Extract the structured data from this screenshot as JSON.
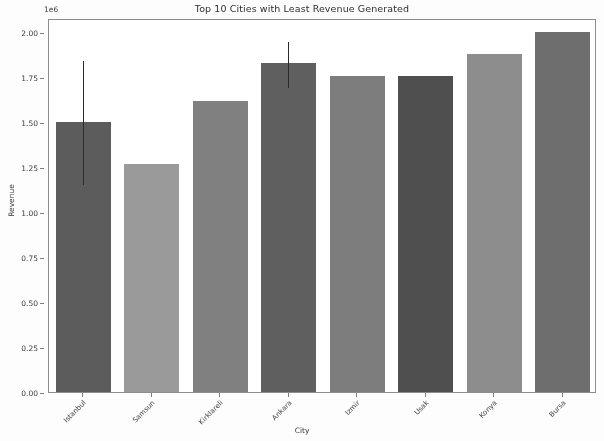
{
  "chart_data": {
    "type": "bar",
    "title": "Top 10 Cities with Least Revenue Generated",
    "xlabel": "City",
    "ylabel": "Revenue",
    "y_offset_label": "1e6",
    "categories": [
      "Istanbul",
      "Samsun",
      "Kirklareli",
      "Ankara",
      "Izmir",
      "Usak",
      "Konya",
      "Bursa"
    ],
    "values": [
      1.5,
      1.27,
      1.62,
      1.83,
      1.76,
      1.76,
      1.88,
      2.0
    ],
    "errors": [
      {
        "category": "Istanbul",
        "low": 1.16,
        "high": 1.85
      },
      {
        "category": "Ankara",
        "low": 1.7,
        "high": 1.96
      }
    ],
    "bar_colors": [
      "#5c5c5c",
      "#9a9a9a",
      "#808080",
      "#5f5f5f",
      "#7d7d7d",
      "#4f4f4f",
      "#8d8d8d",
      "#6e6e6e"
    ],
    "ylim": [
      0.0,
      2.08
    ],
    "ytick_labels": [
      "0.00",
      "0.25",
      "0.50",
      "0.75",
      "1.00",
      "1.25",
      "1.50",
      "1.75",
      "2.00"
    ],
    "ytick_values": [
      0.0,
      0.25,
      0.5,
      0.75,
      1.0,
      1.25,
      1.5,
      1.75,
      2.0
    ],
    "grid": false,
    "legend": "none"
  }
}
